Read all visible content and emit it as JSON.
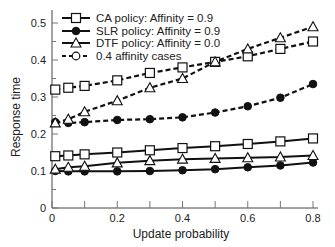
{
  "chart_data": {
    "type": "line",
    "title": "",
    "xlabel": "Update probability",
    "ylabel": "Response time",
    "xlim": [
      0,
      0.82
    ],
    "ylim": [
      0,
      0.52
    ],
    "x_ticks": [
      "0",
      "0.2",
      "0.4",
      "0.6",
      "0.8"
    ],
    "y_ticks": [
      "0",
      "0.1",
      "0.2",
      "0.3",
      "0.4",
      "0.5"
    ],
    "grid": false,
    "legend_position": "upper left",
    "legend": [
      "CA policy: Affinity = 0.9",
      "SLR policy: Affinity = 0.9",
      "DTF policy: Affinity = 0.0",
      "0.4 affinity cases"
    ],
    "x": [
      0.01,
      0.05,
      0.1,
      0.2,
      0.3,
      0.4,
      0.5,
      0.6,
      0.7,
      0.8
    ],
    "series": [
      {
        "name": "CA policy: Affinity = 0.9",
        "marker": "square",
        "style": "solid",
        "values": [
          0.14,
          0.142,
          0.145,
          0.15,
          0.156,
          0.162,
          0.167,
          0.173,
          0.18,
          0.188
        ]
      },
      {
        "name": "SLR policy: Affinity = 0.9",
        "marker": "circle-filled",
        "style": "solid",
        "values": [
          0.1,
          0.099,
          0.099,
          0.099,
          0.1,
          0.102,
          0.105,
          0.11,
          0.115,
          0.123
        ]
      },
      {
        "name": "DTF policy: Affinity = 0.0",
        "marker": "triangle",
        "style": "solid",
        "values": [
          0.105,
          0.11,
          0.113,
          0.122,
          0.128,
          0.132,
          0.134,
          0.136,
          0.138,
          0.142
        ]
      },
      {
        "name": "CA policy: Affinity = 0.4",
        "marker": "square",
        "style": "dashed",
        "values": [
          0.32,
          0.325,
          0.33,
          0.345,
          0.365,
          0.38,
          0.395,
          0.41,
          0.43,
          0.45
        ]
      },
      {
        "name": "SLR policy: Affinity = 0.4",
        "marker": "circle-filled",
        "style": "dashed",
        "values": [
          0.232,
          0.23,
          0.232,
          0.238,
          0.24,
          0.245,
          0.258,
          0.275,
          0.298,
          0.335
        ]
      },
      {
        "name": "DTF policy: Affinity = 0.4",
        "marker": "triangle",
        "style": "dashed",
        "values": [
          0.23,
          0.24,
          0.26,
          0.29,
          0.325,
          0.35,
          0.395,
          0.43,
          0.46,
          0.49
        ]
      }
    ]
  }
}
